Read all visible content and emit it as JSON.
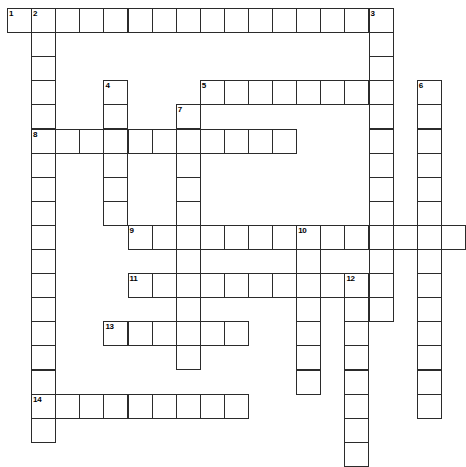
{
  "puzzle": {
    "type": "crossword-grid",
    "title": "",
    "grid_origin": {
      "x": 7,
      "y": 8
    },
    "cell_size": 24.1,
    "colors": {
      "cell_border": "#2b2b2b",
      "cell_fill": "#ffffff",
      "background": "#ffffff",
      "number_text": "#000000"
    },
    "entries": [
      {
        "number": "1",
        "direction": "across",
        "row": 0,
        "col": 0,
        "length": 15
      },
      {
        "number": "2",
        "direction": "down",
        "row": 0,
        "col": 1,
        "length": 18
      },
      {
        "number": "3",
        "direction": "down",
        "row": 0,
        "col": 15,
        "length": 13
      },
      {
        "number": "4",
        "direction": "down",
        "row": 3,
        "col": 4,
        "length": 6
      },
      {
        "number": "5",
        "direction": "across",
        "row": 3,
        "col": 8,
        "length": 8
      },
      {
        "number": "6",
        "direction": "down",
        "row": 3,
        "col": 17,
        "length": 14
      },
      {
        "number": "7",
        "direction": "down",
        "row": 4,
        "col": 7,
        "length": 11
      },
      {
        "number": "8",
        "direction": "across",
        "row": 5,
        "col": 1,
        "length": 11
      },
      {
        "number": "9",
        "direction": "across",
        "row": 9,
        "col": 5,
        "length": 14
      },
      {
        "number": "10",
        "direction": "down",
        "row": 9,
        "col": 12,
        "length": 7
      },
      {
        "number": "11",
        "direction": "across",
        "row": 11,
        "col": 5,
        "length": 10
      },
      {
        "number": "12",
        "direction": "down",
        "row": 11,
        "col": 14,
        "length": 8
      },
      {
        "number": "13",
        "direction": "across",
        "row": 13,
        "col": 4,
        "length": 6
      },
      {
        "number": "14",
        "direction": "across",
        "row": 16,
        "col": 1,
        "length": 9
      }
    ],
    "numbered_cells": [
      {
        "label": "1",
        "row": 0,
        "col": 0
      },
      {
        "label": "2",
        "row": 0,
        "col": 1
      },
      {
        "label": "3",
        "row": 0,
        "col": 15
      },
      {
        "label": "4",
        "row": 3,
        "col": 4
      },
      {
        "label": "5",
        "row": 3,
        "col": 8
      },
      {
        "label": "6",
        "row": 3,
        "col": 17
      },
      {
        "label": "7",
        "row": 4,
        "col": 7
      },
      {
        "label": "8",
        "row": 5,
        "col": 1
      },
      {
        "label": "9",
        "row": 9,
        "col": 5
      },
      {
        "label": "10",
        "row": 9,
        "col": 12
      },
      {
        "label": "11",
        "row": 11,
        "col": 5
      },
      {
        "label": "12",
        "row": 11,
        "col": 14
      },
      {
        "label": "13",
        "row": 13,
        "col": 4
      },
      {
        "label": "14",
        "row": 16,
        "col": 1
      }
    ],
    "letters": []
  }
}
